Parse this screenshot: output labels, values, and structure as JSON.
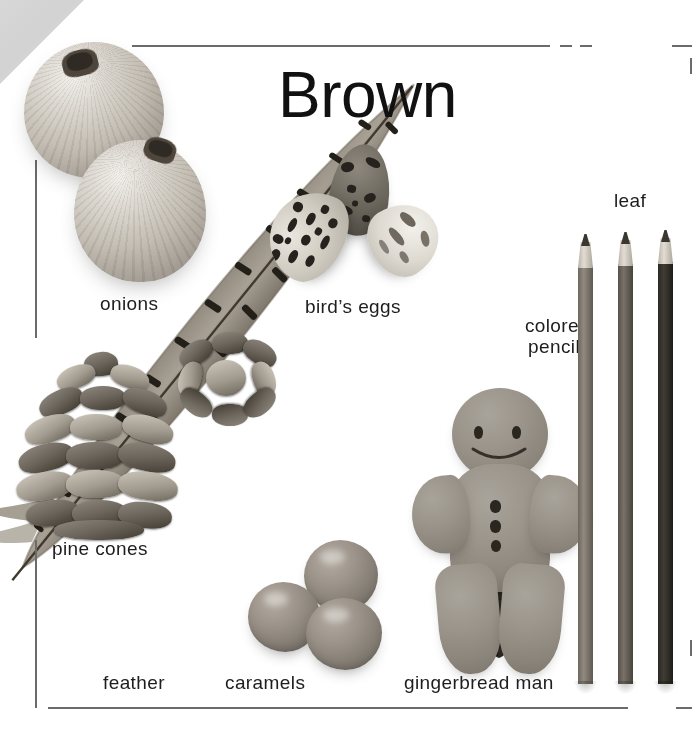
{
  "page": {
    "title": "Brown",
    "theme_color": "#8a7055",
    "background_color": "#ffffff",
    "rule_color": "#6b6b6b",
    "text_color": "#1d1d1d",
    "width": 699,
    "height": 753
  },
  "labels": {
    "onions": "onions",
    "birds_eggs": "bird’s eggs",
    "colored_pencils_line1": "colored",
    "colored_pencils_line2": "pencils",
    "leaf": "leaf",
    "pine_cones": "pine cones",
    "feather": "feather",
    "caramels": "caramels",
    "gingerbread_man": "gingerbread man"
  },
  "items": [
    {
      "name": "onions",
      "label": "onions",
      "count": 2
    },
    {
      "name": "birds-eggs",
      "label": "bird’s eggs",
      "count": 3
    },
    {
      "name": "feather",
      "label": "feather",
      "count": 1
    },
    {
      "name": "pine-cones",
      "label": "pine cones",
      "count": 2
    },
    {
      "name": "caramels",
      "label": "caramels",
      "count": 3
    },
    {
      "name": "gingerbread-man",
      "label": "gingerbread man",
      "count": 1
    },
    {
      "name": "colored-pencils",
      "label": "colored pencils",
      "count": 3
    },
    {
      "name": "leaf",
      "label": "leaf",
      "count": 1
    }
  ]
}
